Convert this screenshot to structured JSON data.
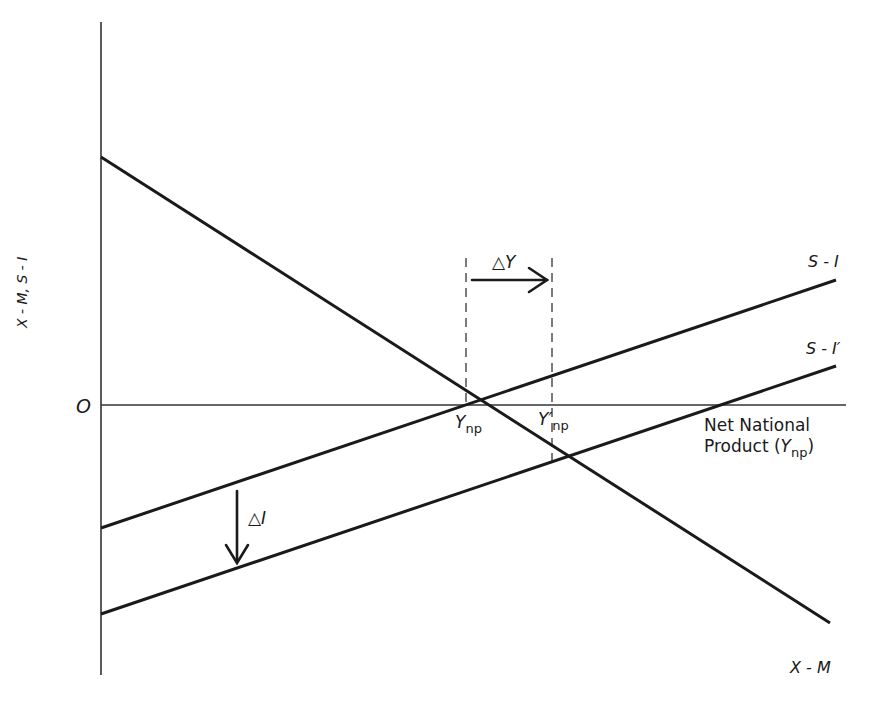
{
  "diagram": {
    "type": "economics line diagram",
    "axes": {
      "y_label": "X - M, S - I",
      "x_label_line1": "Net National",
      "x_label_line2_prefix": "Product (",
      "x_label_var": "Y",
      "x_label_sub": "np",
      "x_label_suffix": ")",
      "origin_label": "O"
    },
    "lines": [
      {
        "name": "X - M",
        "label": "X - M",
        "from": [
          101,
          157
        ],
        "to": [
          830,
          623
        ]
      },
      {
        "name": "S - I",
        "label": "S - I",
        "from": [
          101,
          528
        ],
        "to": [
          836,
          280
        ]
      },
      {
        "name": "S - I'",
        "label": "S - I′",
        "from": [
          101,
          614
        ],
        "to": [
          836,
          366
        ]
      }
    ],
    "equilibria": [
      {
        "label_var": "Y",
        "label_sub": "np",
        "point": [
          463,
          405
        ]
      },
      {
        "label_var": "Y′",
        "label_sub": "np",
        "point": [
          553,
          461
        ]
      }
    ],
    "annotations": {
      "delta_y": "△Y",
      "delta_i": "△I"
    },
    "colors": {
      "ink": "#1a1a1a",
      "axis": "#333333",
      "dash": "#444444",
      "background": "#ffffff"
    }
  }
}
